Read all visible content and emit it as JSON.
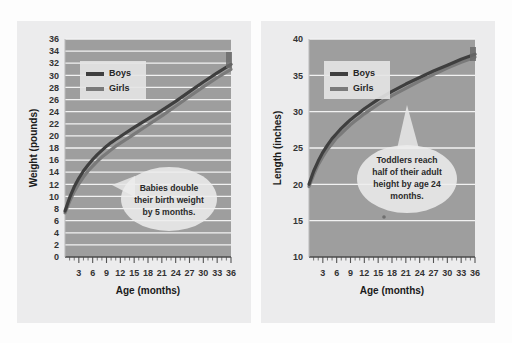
{
  "figure": {
    "background_color": "#fdfdfd",
    "panel_color": "#ececed",
    "plot_color": "#9e9e9e",
    "gridline_color": "#f2f2f2"
  },
  "chart_data": [
    {
      "type": "line",
      "title": "",
      "xlabel": "Age (months)",
      "ylabel": "Weight (pounds)",
      "xlim": [
        0,
        36
      ],
      "ylim": [
        0,
        36
      ],
      "xticks": [
        3,
        6,
        9,
        12,
        15,
        18,
        21,
        24,
        27,
        30,
        33,
        36
      ],
      "yticks": [
        0,
        2,
        4,
        6,
        8,
        10,
        12,
        14,
        16,
        18,
        20,
        22,
        24,
        26,
        28,
        30,
        32,
        34,
        36
      ],
      "grid": "horizontal",
      "legend_position": "upper left",
      "x": [
        0,
        1,
        2,
        3,
        4,
        5,
        6,
        7,
        8,
        9,
        10,
        11,
        12,
        15,
        18,
        21,
        24,
        27,
        30,
        33,
        36
      ],
      "series": [
        {
          "name": "Boys",
          "color": "#3f3f3f",
          "values": [
            7.6,
            9.8,
            11.6,
            13.0,
            14.2,
            15.2,
            16.1,
            16.9,
            17.6,
            18.3,
            18.9,
            19.4,
            19.9,
            21.4,
            22.8,
            24.2,
            25.7,
            27.3,
            28.9,
            30.4,
            31.8
          ]
        },
        {
          "name": "Girls",
          "color": "#7a7a7a",
          "values": [
            7.3,
            9.2,
            10.8,
            12.1,
            13.2,
            14.2,
            15.0,
            15.8,
            16.5,
            17.1,
            17.7,
            18.3,
            18.8,
            20.3,
            21.8,
            23.3,
            24.9,
            26.5,
            28.1,
            29.6,
            31.0
          ]
        }
      ],
      "annotation": {
        "lines": [
          "Babies double",
          "their birth weight",
          "by 5 months."
        ],
        "shape": "ellipse-callout",
        "tail_direction": "left"
      }
    },
    {
      "type": "line",
      "title": "",
      "xlabel": "Age (months)",
      "ylabel": "Length (inches)",
      "xlim": [
        0,
        36
      ],
      "ylim": [
        10,
        40
      ],
      "xticks": [
        3,
        6,
        9,
        12,
        15,
        18,
        21,
        24,
        27,
        30,
        33,
        36
      ],
      "yticks": [
        10,
        15,
        20,
        25,
        30,
        35,
        40
      ],
      "grid": "horizontal",
      "legend_position": "upper left",
      "x": [
        0,
        1,
        2,
        3,
        4,
        5,
        6,
        7,
        8,
        9,
        10,
        11,
        12,
        15,
        18,
        21,
        24,
        27,
        30,
        33,
        36
      ],
      "series": [
        {
          "name": "Boys",
          "color": "#3f3f3f",
          "values": [
            20.0,
            21.8,
            23.2,
            24.4,
            25.4,
            26.3,
            27.0,
            27.7,
            28.3,
            28.9,
            29.4,
            29.9,
            30.4,
            31.7,
            32.8,
            33.8,
            34.7,
            35.6,
            36.4,
            37.2,
            37.9
          ]
        },
        {
          "name": "Girls",
          "color": "#7a7a7a",
          "values": [
            19.7,
            21.3,
            22.7,
            23.8,
            24.8,
            25.6,
            26.4,
            27.0,
            27.6,
            28.2,
            28.7,
            29.2,
            29.7,
            31.0,
            32.2,
            33.2,
            34.2,
            35.1,
            36.0,
            36.8,
            37.5
          ]
        }
      ],
      "annotation": {
        "lines": [
          "Toddlers reach",
          "half of their adult",
          "height by age 24",
          "months."
        ],
        "shape": "ellipse-callout",
        "tail_direction": "up"
      }
    }
  ],
  "legend": {
    "boys_label": "Boys",
    "girls_label": "Girls",
    "boys_color": "#3f3f3f",
    "girls_color": "#7a7a7a"
  }
}
